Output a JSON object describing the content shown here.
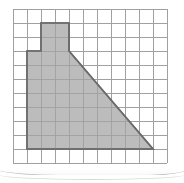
{
  "figure": {
    "grid": {
      "origin_x": 13,
      "origin_y": 9,
      "cell_size": 14,
      "cols": 11,
      "rows": 11,
      "line_color": "#a0a0a0",
      "line_width": 1,
      "background": "#ffffff"
    },
    "shape": {
      "name": "shaded-polygon",
      "fill_color": "#b0b0b0",
      "fill_opacity": 0.85,
      "stroke_color": "#6b6b6b",
      "stroke_width": 1.6,
      "vertices_grid": [
        [
          2,
          1
        ],
        [
          4,
          1
        ],
        [
          4,
          3
        ],
        [
          10,
          10
        ],
        [
          1,
          10
        ],
        [
          1,
          3
        ],
        [
          2,
          3
        ]
      ],
      "description": "An L-shaped tower on top of a right trapezoid: a 2x2 square block rises from columns 2-4 rows 1-3, the body spans columns 1-10 down to row 10, with a straight diagonal edge from grid point (4,3) to (10,10)."
    },
    "page_edge": {
      "visible": true,
      "color": "#b9b9b9"
    }
  }
}
